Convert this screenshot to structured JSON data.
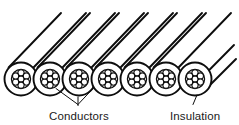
{
  "figure": {
    "background_color": "#ffffff",
    "line_color": "#0d0d0d",
    "text_color": "#1a1a1a"
  },
  "labels": {
    "conductors": "Conductors",
    "insulation": "Insulation"
  },
  "diagram_data": {
    "type": "line-art-diagram",
    "subject": "stranded multi-conductor cable",
    "bundle_count": 7,
    "strands_per_bundle": 7,
    "strand_arrangement": "1 center + 6 hexagonal ring",
    "bundles": [
      {
        "index": 1,
        "cx": 21,
        "cy": 79,
        "r_sheath": 16.5,
        "r_core": 9.6,
        "r_strand": 3.1
      },
      {
        "index": 2,
        "cx": 50,
        "cy": 79,
        "r_sheath": 16.5,
        "r_core": 9.6,
        "r_strand": 3.1
      },
      {
        "index": 3,
        "cx": 79,
        "cy": 79,
        "r_sheath": 16.5,
        "r_core": 9.6,
        "r_strand": 3.1
      },
      {
        "index": 4,
        "cx": 108,
        "cy": 79,
        "r_sheath": 16.5,
        "r_core": 9.6,
        "r_strand": 3.1
      },
      {
        "index": 5,
        "cx": 137,
        "cy": 79,
        "r_sheath": 16.5,
        "r_core": 9.6,
        "r_strand": 3.1
      },
      {
        "index": 6,
        "cx": 166,
        "cy": 79,
        "r_sheath": 16.5,
        "r_core": 9.6,
        "r_strand": 3.1
      },
      {
        "index": 7,
        "cx": 195,
        "cy": 79,
        "r_sheath": 16.5,
        "r_core": 9.6,
        "r_strand": 3.1
      }
    ],
    "jacket_lines": {
      "angle_degrees": 45,
      "description": "pairs of parallel 45-degree lines running up-right from each conductor, representing the cable body in perspective",
      "count": 8
    },
    "leaders": [
      {
        "label": "Conductors",
        "targets": [
          2,
          3
        ],
        "style": "two-branch converging arrow"
      },
      {
        "label": "Insulation",
        "targets": [
          7
        ],
        "style": "single short line to sheath ring"
      }
    ],
    "label_positions": {
      "conductors": {
        "x": 49,
        "y": 119
      },
      "insulation": {
        "x": 170,
        "y": 119
      }
    }
  }
}
